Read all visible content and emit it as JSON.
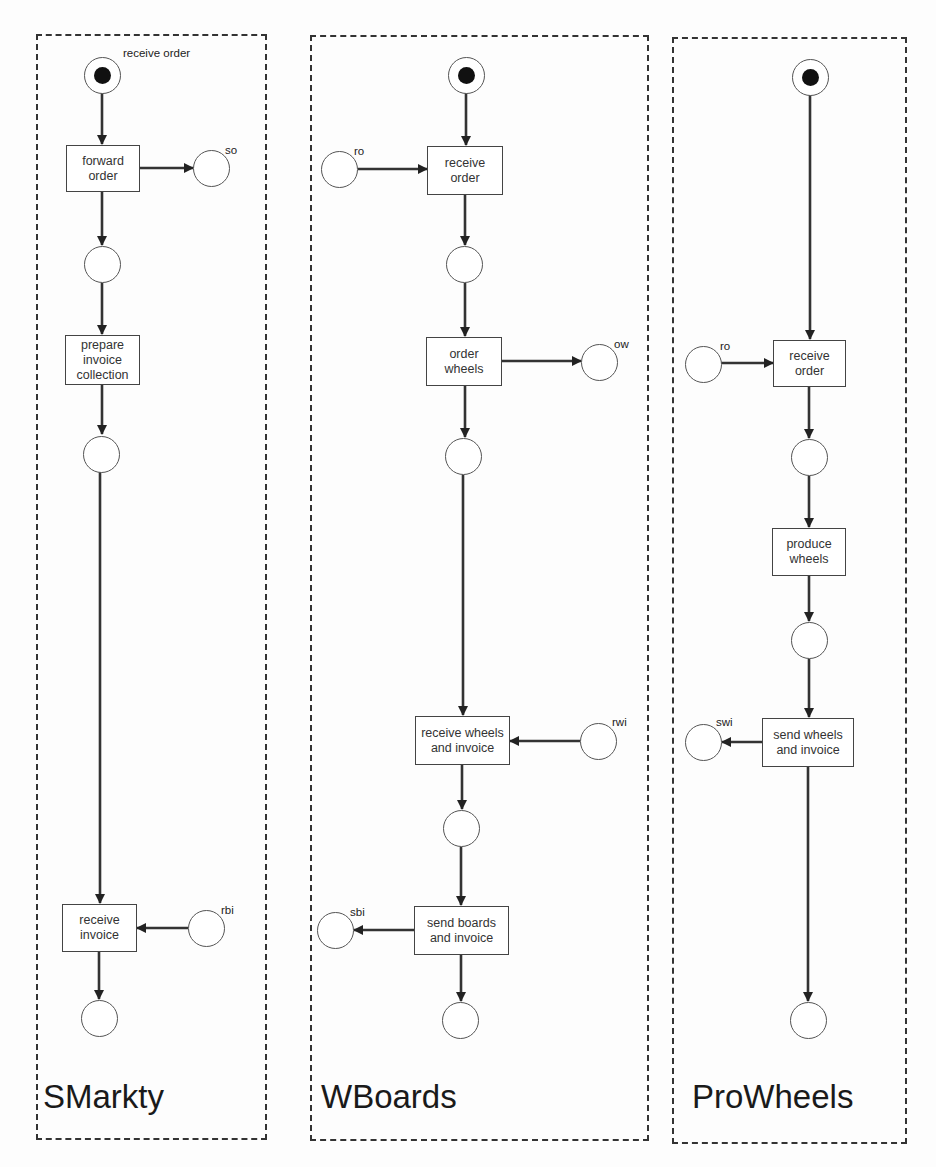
{
  "diagram": {
    "type": "petri-net-collaboration",
    "lanes": [
      {
        "id": "smarkty",
        "label": "SMarkty",
        "start_place_label": "receive order",
        "transitions": [
          "forward order",
          "prepare invoice collection",
          "receive invoice"
        ],
        "message_places": [
          {
            "label": "so",
            "direction": "out",
            "transition": "forward order"
          },
          {
            "label": "rbi",
            "direction": "in",
            "transition": "receive invoice"
          }
        ]
      },
      {
        "id": "wboards",
        "label": "WBoards",
        "transitions": [
          "receive order",
          "order wheels",
          "receive wheels and invoice",
          "send boards and invoice"
        ],
        "message_places": [
          {
            "label": "ro",
            "direction": "in",
            "transition": "receive order"
          },
          {
            "label": "ow",
            "direction": "out",
            "transition": "order wheels"
          },
          {
            "label": "rwi",
            "direction": "in",
            "transition": "receive wheels and invoice"
          },
          {
            "label": "sbi",
            "direction": "out",
            "transition": "send boards and invoice"
          }
        ]
      },
      {
        "id": "prowheels",
        "label": "ProWheels",
        "transitions": [
          "receive order",
          "produce wheels",
          "send wheels and invoice"
        ],
        "message_places": [
          {
            "label": "ro",
            "direction": "in",
            "transition": "receive order"
          },
          {
            "label": "swi",
            "direction": "out",
            "transition": "send wheels and invoice"
          }
        ]
      }
    ]
  },
  "labels": {
    "smarkty": {
      "lane": "SMarkty",
      "start": "receive order",
      "t_forward": "forward order",
      "t_prepare": "prepare invoice collection",
      "t_receive_invoice": "receive invoice",
      "p_so": "so",
      "p_rbi": "rbi"
    },
    "wboards": {
      "lane": "WBoards",
      "t_receive_order": "receive order",
      "t_order_wheels": "order wheels",
      "t_receive_wheels": "receive wheels and invoice",
      "t_send_boards": "send boards and invoice",
      "p_ro": "ro",
      "p_ow": "ow",
      "p_rwi": "rwi",
      "p_sbi": "sbi"
    },
    "prowheels": {
      "lane": "ProWheels",
      "t_receive_order": "receive order",
      "t_produce": "produce wheels",
      "t_send": "send wheels and invoice",
      "p_ro": "ro",
      "p_swi": "swi"
    }
  },
  "colors": {
    "stroke": "#333333",
    "token": "#111111",
    "background": "#fdfdfd"
  }
}
